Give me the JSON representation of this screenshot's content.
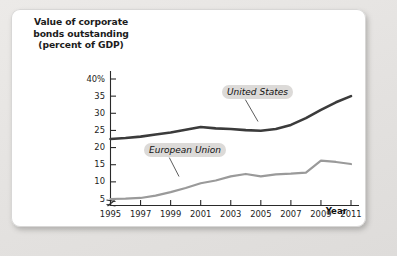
{
  "figure": {
    "y_axis_title_lines": [
      "Value of corporate",
      "bonds outstanding",
      "(percent of GDP)"
    ],
    "x_axis_name": "Year"
  },
  "chart_data": {
    "type": "line",
    "title": "Value of corporate bonds outstanding (percent of GDP)",
    "xlabel": "Year",
    "ylabel": "Value of corporate bonds outstanding (percent of GDP)",
    "xlim": [
      1995,
      2011
    ],
    "ylim": [
      4,
      40
    ],
    "grid": false,
    "legend_position": "inline-annotation",
    "axis_break": true,
    "x": [
      1995,
      1996,
      1997,
      1998,
      1999,
      2000,
      2001,
      2002,
      2003,
      2004,
      2005,
      2006,
      2007,
      2008,
      2009,
      2010,
      2011
    ],
    "xticks": [
      1995,
      1997,
      1999,
      2001,
      2003,
      2005,
      2007,
      2009,
      2011
    ],
    "xticklabels": [
      "1995",
      "1997",
      "1999",
      "2001",
      "2003",
      "2005",
      "2007",
      "2009",
      "2011"
    ],
    "yticks": [
      5,
      10,
      15,
      20,
      25,
      30,
      35,
      40
    ],
    "yticklabels": [
      "5",
      "10",
      "15",
      "20",
      "25",
      "30",
      "35",
      "40%"
    ],
    "series": [
      {
        "name": "United States",
        "color": "#3b3b3b",
        "values": [
          22.5,
          22.8,
          23.2,
          23.8,
          24.4,
          25.2,
          26.0,
          25.6,
          25.4,
          25.1,
          24.9,
          25.4,
          26.6,
          28.6,
          31.0,
          33.2,
          35.0
        ]
      },
      {
        "name": "European Union",
        "color": "#9a9a9a",
        "values": [
          5.0,
          5.1,
          5.3,
          6.0,
          7.0,
          8.2,
          9.6,
          10.4,
          11.6,
          12.3,
          11.6,
          12.2,
          12.4,
          12.7,
          16.2,
          15.8,
          15.2
        ]
      }
    ],
    "annotations": [
      {
        "text": "United States",
        "series": "United States"
      },
      {
        "text": "European Union",
        "series": "European Union"
      }
    ]
  },
  "colors": {
    "united_states_line": "#3b3b3b",
    "european_union_line": "#9a9a9a",
    "panel_background": "#ffffff",
    "page_background": "#e8e7e5",
    "label_chip_background": "#dcdad8",
    "axis": "#2a2a2a"
  }
}
